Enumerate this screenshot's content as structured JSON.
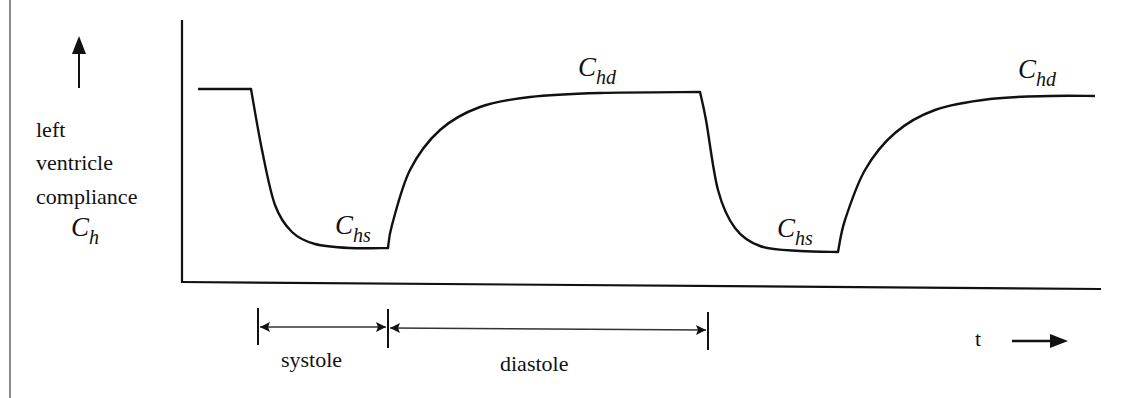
{
  "chart_data": {
    "type": "line",
    "title": "",
    "ylabel": "left ventricle compliance C_h",
    "ylabel_lines": [
      "left",
      "ventricle",
      "compliance"
    ],
    "ylabel_symbol": {
      "base": "C",
      "sub": "h"
    },
    "xlabel": "t",
    "grid": false,
    "series": [
      {
        "name": "C_h(t)",
        "points_px": [
          [
            198,
            89
          ],
          [
            251,
            89
          ],
          [
            262,
            150
          ],
          [
            275,
            205
          ],
          [
            292,
            232
          ],
          [
            315,
            244
          ],
          [
            350,
            248
          ],
          [
            388,
            248
          ],
          [
            392,
            225
          ],
          [
            410,
            170
          ],
          [
            440,
            130
          ],
          [
            480,
            107
          ],
          [
            530,
            97
          ],
          [
            600,
            93
          ],
          [
            700,
            92
          ],
          [
            706,
            120
          ],
          [
            718,
            190
          ],
          [
            735,
            228
          ],
          [
            760,
            246
          ],
          [
            800,
            251
          ],
          [
            838,
            252
          ],
          [
            845,
            220
          ],
          [
            865,
            170
          ],
          [
            895,
            133
          ],
          [
            935,
            110
          ],
          [
            990,
            99
          ],
          [
            1050,
            96
          ],
          [
            1095,
            96
          ]
        ]
      }
    ],
    "levels": {
      "C_hd": "high (diastolic) compliance",
      "C_hs": "low (systolic) compliance"
    },
    "annotations": [
      {
        "text": "C_hd",
        "base": "C",
        "sub": "hd",
        "position": "first plateau"
      },
      {
        "text": "C_hs",
        "base": "C",
        "sub": "hs",
        "position": "first minimum"
      },
      {
        "text": "C_hs",
        "base": "C",
        "sub": "hs",
        "position": "second minimum"
      },
      {
        "text": "C_hd",
        "base": "C",
        "sub": "hd",
        "position": "second plateau"
      }
    ],
    "intervals": [
      {
        "label": "systole",
        "start_px": 258,
        "end_px": 388
      },
      {
        "label": "diastole",
        "start_px": 388,
        "end_px": 708
      }
    ]
  },
  "ui": {
    "y_arrow": "up-arrow",
    "ylabel_lines": [
      "left",
      "ventricle",
      "compliance"
    ],
    "ylabel_symbol_base": "C",
    "ylabel_symbol_sub": "h",
    "labels": {
      "chd1_base": "C",
      "chd1_sub": "hd",
      "chs1_base": "C",
      "chs1_sub": "hs",
      "chs2_base": "C",
      "chs2_sub": "hs",
      "chd2_base": "C",
      "chd2_sub": "hd",
      "systole": "systole",
      "diastole": "diastole",
      "time": "t"
    }
  }
}
